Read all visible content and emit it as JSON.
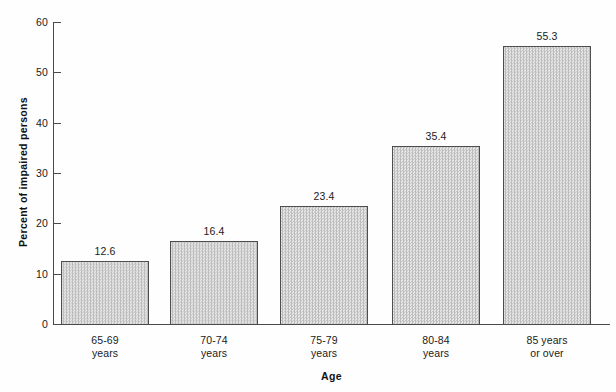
{
  "chart_data": {
    "type": "bar",
    "title": "",
    "xlabel": "Age",
    "ylabel": "Percent of impaired persons",
    "categories": [
      "65-69\nyears",
      "70-74\nyears",
      "75-79\nyears",
      "80-84\nyears",
      "85 years\nor over"
    ],
    "category_lines": [
      [
        "65-69",
        "years"
      ],
      [
        "70-74",
        "years"
      ],
      [
        "75-79",
        "years"
      ],
      [
        "80-84",
        "years"
      ],
      [
        "85 years",
        "or over"
      ]
    ],
    "values": [
      12.6,
      16.4,
      23.4,
      35.4,
      55.3
    ],
    "value_labels": [
      "12.6",
      "16.4",
      "23.4",
      "35.4",
      "55.3"
    ],
    "ylim": [
      0,
      60
    ],
    "ytick_values": [
      0,
      10,
      20,
      30,
      40,
      50,
      60
    ],
    "ytick_labels": [
      "0",
      "10",
      "20",
      "30",
      "40",
      "50",
      "60"
    ],
    "grid": false,
    "legend": null,
    "bar_fill": "#d6d6d6",
    "bar_edge": "#4e4e4e",
    "axis_color": "#4a4a4a",
    "background": "#fefefe"
  }
}
